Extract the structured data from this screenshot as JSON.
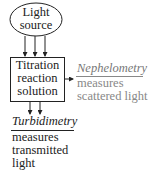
{
  "diagram": {
    "light_source": {
      "line1": "Light",
      "line2": "source"
    },
    "reaction_box": {
      "line1": "Titration",
      "line2": "reaction",
      "line3": "solution"
    },
    "nephelometry": {
      "title": "Nephelometry",
      "line1": "measures",
      "line2": "scattered light"
    },
    "turbidimetry": {
      "title": "Turbidimetry",
      "line1": "measures",
      "line2": "transmitted",
      "line3": "light"
    },
    "colors": {
      "primary": "#222222",
      "secondary": "#888888"
    }
  }
}
